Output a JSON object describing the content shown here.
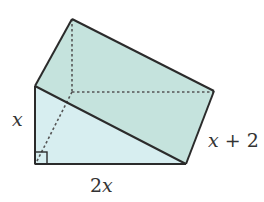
{
  "diagram": {
    "type": "triangular-prism",
    "colors": {
      "top_face": "#c5e3dd",
      "front_face": "#d7eef0",
      "edge": "#2b2b2b",
      "hidden_edge": "#555555"
    },
    "labels": {
      "height": "x",
      "base": "2x",
      "length": "x + 2"
    },
    "right_angle_marker": true
  }
}
